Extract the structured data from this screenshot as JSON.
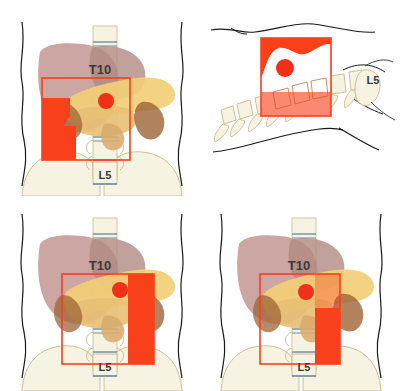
{
  "figure": {
    "layout": "2x2 grid of anatomical panels",
    "background_color": "#ffffff"
  },
  "palette": {
    "red_marker": "#F03018",
    "red_box_stroke": "#F8401A",
    "red_fill": "#F8401A",
    "red_fill_translucent": "#F8401A",
    "liver": "#C49A95",
    "liver_dark": "#B08A83",
    "stomach_yellow": "#F2CE76",
    "pancreas_tan": "#D9A96B",
    "kidney_brown": "#9E6437",
    "bone_cream": "#F7F3E2",
    "bone_outline": "#C8B88A",
    "disc_blue": "#6E8CA8",
    "body_outline": "#1A1A1A",
    "label_text": "#3A3A3A"
  },
  "panels": [
    {
      "id": "panel-top-left",
      "name": "anterior-view-1",
      "view": "anterior",
      "labels": {
        "upper": "T10",
        "lower": "L5"
      },
      "roi_box": {
        "x": 42,
        "y": 78,
        "w": 88,
        "h": 82
      },
      "marker_dot": {
        "x": 106,
        "y": 101,
        "r": 8
      },
      "shaded_region": "left-inferior-wedge"
    },
    {
      "id": "panel-top-right",
      "name": "lateral-view",
      "view": "lateral",
      "labels": {
        "lower": "L5"
      },
      "roi_box": {
        "x": 58,
        "y": 38,
        "w": 70,
        "h": 78
      },
      "marker_dot": {
        "x": 82,
        "y": 68,
        "r": 9
      },
      "shaded_region": "full-box-with-white-wave"
    },
    {
      "id": "panel-bottom-left",
      "name": "anterior-view-2",
      "view": "anterior",
      "labels": {
        "upper": "T10",
        "lower": "L5"
      },
      "roi_box": {
        "x": 62,
        "y": 78,
        "w": 92,
        "h": 90
      },
      "marker_dot": {
        "x": 120,
        "y": 94,
        "r": 8
      },
      "shaded_region": "right-vertical-band"
    },
    {
      "id": "panel-bottom-right",
      "name": "anterior-view-3",
      "view": "anterior",
      "labels": {
        "upper": "T10",
        "lower": "L5"
      },
      "roi_box": {
        "x": 57,
        "y": 78,
        "w": 80,
        "h": 90
      },
      "marker_dot": {
        "x": 103,
        "y": 96,
        "r": 8
      },
      "shaded_region": "right-narrow-band"
    }
  ],
  "labels": {
    "t10": "T10",
    "l5": "L5"
  }
}
